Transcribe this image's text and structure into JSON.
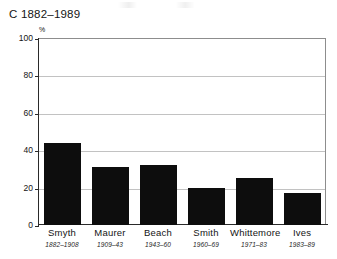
{
  "chart_data": {
    "type": "bar",
    "title": "C 1882–1989",
    "xlabel": "",
    "ylabel": "%",
    "ylim": [
      0,
      100
    ],
    "ytick_values": [
      100,
      80,
      60,
      40,
      20,
      0
    ],
    "ytick_labels": [
      "100",
      "80",
      "60",
      "40",
      "20",
      "0"
    ],
    "grid": true,
    "legend": "none",
    "bar_color": "#0d0d0d",
    "categories": [
      "Smyth",
      "Maurer",
      "Beach",
      "Smith",
      "Whittemore",
      "Ives"
    ],
    "category_subtitles": [
      "1882–1908",
      "1909–43",
      "1943–60",
      "1960–69",
      "1971–83",
      "1983–89"
    ],
    "values": [
      44,
      31,
      32,
      20,
      25,
      17
    ],
    "series": [
      {
        "name": "C",
        "values": [
          44,
          31,
          32,
          20,
          25,
          17
        ]
      }
    ],
    "points": [
      {
        "category": "Smyth",
        "subtitle": "1882–1908",
        "value": 44
      },
      {
        "category": "Maurer",
        "subtitle": "1909–43",
        "value": 31
      },
      {
        "category": "Beach",
        "subtitle": "1943–60",
        "value": 32
      },
      {
        "category": "Smith",
        "subtitle": "1960–69",
        "value": 20
      },
      {
        "category": "Whittemore",
        "subtitle": "1971–83",
        "value": 25
      },
      {
        "category": "Ives",
        "subtitle": "1983–89",
        "value": 17
      }
    ]
  }
}
